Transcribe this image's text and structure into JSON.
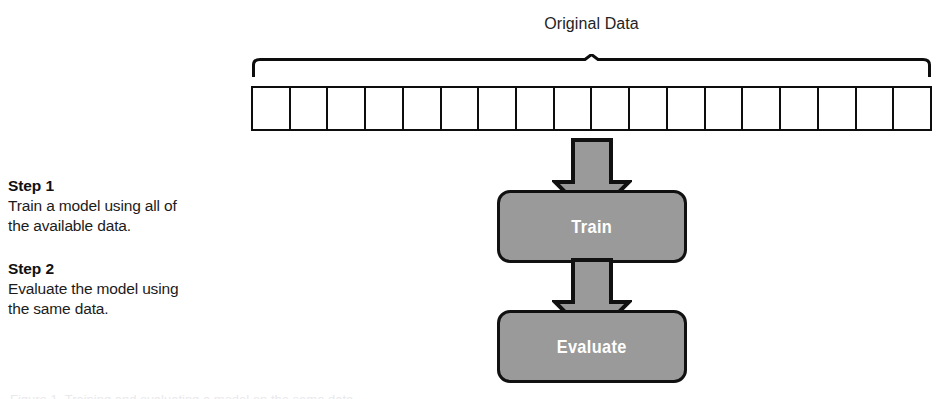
{
  "diagram": {
    "title_label": "Original Data",
    "data_row": {
      "cell_count": 18,
      "cells": [
        "",
        "",
        "",
        "",
        "",
        "",
        "",
        "",
        "",
        "",
        "",
        "",
        "",
        "",
        "",
        "",
        "",
        ""
      ]
    },
    "nodes": [
      {
        "id": "train",
        "label": "Train"
      },
      {
        "id": "evaluate",
        "label": "Evaluate"
      }
    ],
    "arrows": [
      {
        "id": "arrow-to-train",
        "direction": "down"
      },
      {
        "id": "arrow-to-evaluate",
        "direction": "down"
      }
    ],
    "steps": [
      {
        "heading": "Step 1",
        "line1": "Train a model using all of",
        "line2": "the available data."
      },
      {
        "heading": "Step 2",
        "line1": "Evaluate the model using",
        "line2": "the same data."
      }
    ],
    "caption_sliver": "Figure 1. Training and evaluating a model on the same data.",
    "colors": {
      "node_fill": "#9a9a9a",
      "node_stroke": "#111111",
      "node_text": "#ffffff",
      "line": "#0d0d0d",
      "background": "#ffffff",
      "text": "#1a1a1a"
    }
  }
}
